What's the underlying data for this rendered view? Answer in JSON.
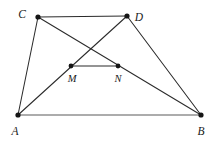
{
  "figure": {
    "type": "geometry-diagram",
    "width": 221,
    "height": 144,
    "background_color": "#ffffff",
    "line_color": "#2b2b2b",
    "base_line_color": "#5a5a5a",
    "vertex_color": "#151515"
  },
  "points": {
    "A": {
      "label": "A",
      "x": 18,
      "y": 115,
      "label_x": 13,
      "label_y": 134
    },
    "B": {
      "label": "B",
      "x": 201,
      "y": 115,
      "label_x": 197,
      "label_y": 134
    },
    "C": {
      "label": "C",
      "x": 38,
      "y": 17,
      "label_x": 22,
      "label_y": 15
    },
    "D": {
      "label": "D",
      "x": 127,
      "y": 16,
      "label_x": 136,
      "label_y": 18
    },
    "M": {
      "label": "M",
      "x": 71,
      "y": 66,
      "label_x": 67,
      "label_y": 82
    },
    "N": {
      "label": "N",
      "x": 118,
      "y": 66,
      "label_x": 114,
      "label_y": 82
    }
  },
  "segments": [
    {
      "name": "AB",
      "from": "A",
      "to": "B",
      "style": "base"
    },
    {
      "name": "AC",
      "from": "A",
      "to": "C",
      "style": "normal"
    },
    {
      "name": "CD",
      "from": "C",
      "to": "D",
      "style": "normal"
    },
    {
      "name": "DB",
      "from": "D",
      "to": "B",
      "style": "normal"
    },
    {
      "name": "AD",
      "from": "A",
      "to": "D",
      "style": "normal"
    },
    {
      "name": "CB",
      "from": "C",
      "to": "B",
      "style": "normal"
    },
    {
      "name": "MN",
      "from": "M",
      "to": "N",
      "style": "normal"
    }
  ],
  "labels": {
    "A": "A",
    "B": "B",
    "C": "C",
    "D": "D",
    "M": "M",
    "N": "N"
  }
}
